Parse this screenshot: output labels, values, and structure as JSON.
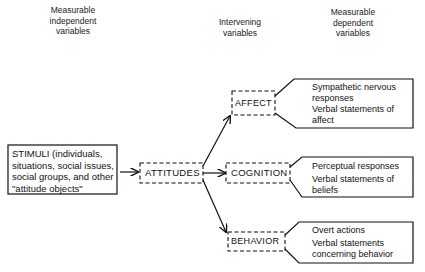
{
  "headers": {
    "independent": [
      "Measurable",
      "independent",
      "variables"
    ],
    "intervening": [
      "Intervening",
      "variables"
    ],
    "dependent": [
      "Measurable",
      "dependent",
      "variables"
    ]
  },
  "stimuli": {
    "lines": [
      "STIMULI (individuals,",
      "situations, social issues,",
      "social groups, and other",
      "\"attitude objects\""
    ]
  },
  "nodes": {
    "attitudes": "ATTITUDES",
    "affect": "AFFECT",
    "cognition": "COGNITION",
    "behavior": "BEHAVIOR"
  },
  "outcomes": {
    "affect": [
      "Sympathetic nervous",
      "responses",
      "Verbal statements of",
      "affect"
    ],
    "cognition": [
      "Perceptual responses",
      "Verbal statements of",
      "beliefs"
    ],
    "behavior": [
      "Overt actions",
      "Verbal statements",
      "concerning behavior"
    ]
  },
  "colors": {
    "ink": "#111111",
    "background": "#ffffff"
  }
}
